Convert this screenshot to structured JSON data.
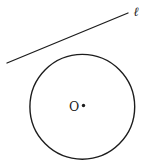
{
  "diagram": {
    "background": "#ffffff",
    "stroke_color": "#1c1c1c",
    "line_width": "1.3",
    "circle_width": "1.4",
    "line": {
      "x1": "7",
      "y1": "63",
      "x2": "128",
      "y2": "13",
      "label": "ℓ",
      "label_x": "136",
      "label_y": "15.5"
    },
    "circle": {
      "cx": "82.3",
      "cy": "106.8",
      "r": "52.4"
    },
    "center_point": {
      "cx": "83.5",
      "cy": "105.5",
      "r": "1.7",
      "label": "O",
      "label_x": "74",
      "label_y": "110.5"
    }
  }
}
